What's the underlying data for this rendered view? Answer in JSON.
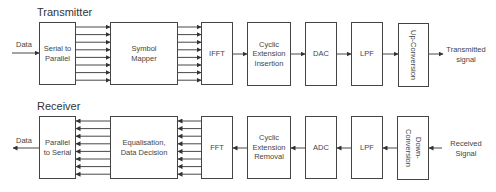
{
  "transmitter": {
    "title": "Transmitter",
    "input_label": "Data",
    "output_label_1": "Transmitted",
    "output_label_2": "signal",
    "blocks": [
      {
        "label": "Serial to Parallel"
      },
      {
        "label": "Symbol Mapper"
      },
      {
        "label": "IFFT"
      },
      {
        "label": "Cyclic Extension Insertion"
      },
      {
        "label": "DAC"
      },
      {
        "label": "LPF"
      },
      {
        "label": "Up-Conversion"
      }
    ]
  },
  "receiver": {
    "title": "Receiver",
    "output_label": "Data",
    "input_label_1": "Received",
    "input_label_2": "Signal",
    "blocks": [
      {
        "label": "Parallel to Serial"
      },
      {
        "label": "Equalisation, Data Decision"
      },
      {
        "label": "FFT"
      },
      {
        "label": "Cyclic Extension Removal"
      },
      {
        "label": "ADC"
      },
      {
        "label": "LPF"
      },
      {
        "label": "Down-Conversion"
      }
    ]
  },
  "parallel_lines": 8
}
